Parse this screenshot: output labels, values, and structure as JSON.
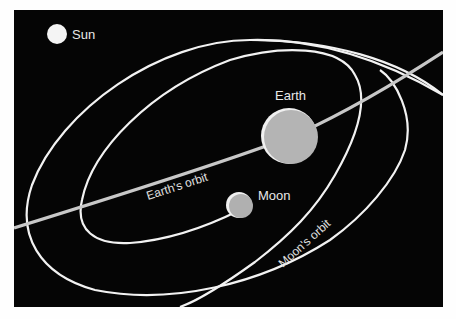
{
  "diagram": {
    "labels": {
      "sun": "Sun",
      "earth": "Earth",
      "moon": "Moon",
      "earth_orbit": "Earth's orbit",
      "moon_orbit": "Moon's orbit"
    },
    "colors": {
      "background": "#050505",
      "page": "#fefefe",
      "orbit_line": "#f2f2f2",
      "earth_orbit_line": "#c8c8c8",
      "sun": "#f4f4f4",
      "earth": "#b4b4b4",
      "moon": "#b0b0b0"
    }
  }
}
